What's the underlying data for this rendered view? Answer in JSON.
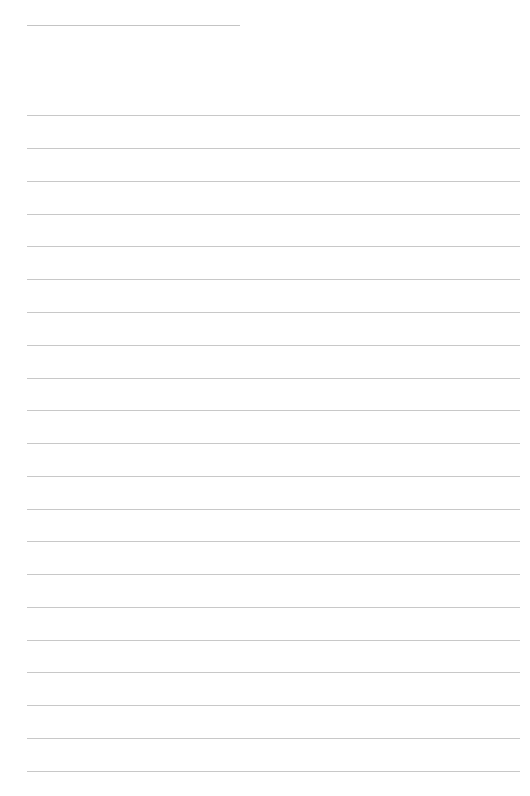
{
  "page": {
    "type": "lined-paper",
    "background": "#ffffff",
    "line_color": "#c8c8c8",
    "header_line": {
      "x": 27,
      "y": 25,
      "width": 213
    },
    "rules": {
      "x": 27,
      "width": 493,
      "y_positions": [
        115,
        148,
        181,
        214,
        246,
        279,
        312,
        345,
        378,
        410,
        443,
        476,
        509,
        541,
        574,
        607,
        640,
        672,
        705,
        738,
        771
      ]
    }
  }
}
